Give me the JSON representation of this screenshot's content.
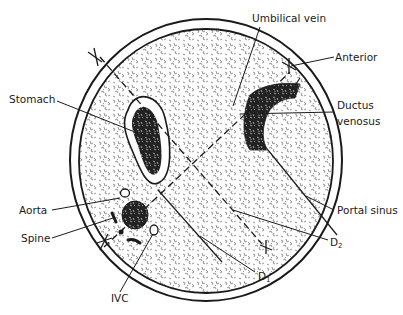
{
  "diagram": {
    "type": "anatomical cross-section",
    "colors": {
      "ink": "#1a1a1a",
      "background": "#ffffff",
      "tissue_speckle": "#7a7a7a"
    },
    "labels": {
      "umbilical_vein": "Umbilical vein",
      "anterior": "Anterior",
      "ductus_venosus_line1": "Ductus",
      "ductus_venosus_line2": "venosus",
      "stomach": "Stomach",
      "aorta": "Aorta",
      "spine": "Spine",
      "portal_sinus": "Portal sinus",
      "d2_main": "D",
      "d2_sub": "2",
      "d1_main": "D",
      "d1_sub": "1",
      "ivc": "IVC"
    },
    "markers": [
      "caliper-x-upper-left",
      "caliper-x-upper-right",
      "caliper-x-lower-left",
      "caliper-x-lower-right"
    ],
    "measurement_lines": [
      "D1",
      "D2"
    ]
  }
}
